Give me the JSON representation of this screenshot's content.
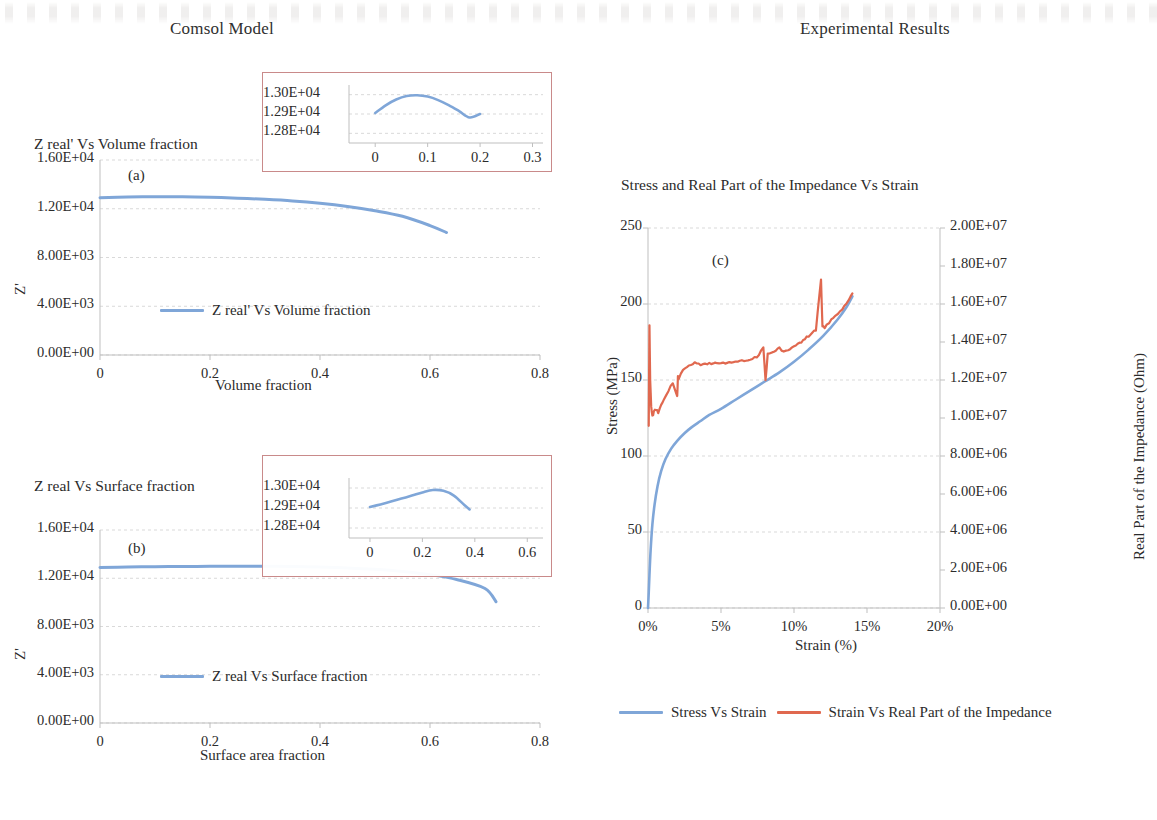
{
  "page": {
    "left_panel_title": "Comsol Model",
    "right_panel_title": "Experimental Results"
  },
  "colors": {
    "series_blue": "#7fa6d8",
    "series_red": "#e0684f",
    "inset_border": "#c98a8a",
    "gridline": "#d9d9d9",
    "axis": "#bfbfbf",
    "text": "#2b2b2b"
  },
  "chart_a": {
    "title": "Z real' Vs Volume fraction",
    "panel_letter": "(a)",
    "xlabel": "Volume fraction",
    "ylabel": "Z'",
    "legend": "Z real' Vs Volume fraction",
    "xticks": [
      "0",
      "0.2",
      "0.4",
      "0.6",
      "0.8"
    ],
    "yticks": [
      "0.00E+00",
      "4.00E+03",
      "8.00E+03",
      "1.20E+04",
      "1.60E+04"
    ],
    "inset": {
      "xticks": [
        "0",
        "0.1",
        "0.2",
        "0.3"
      ],
      "yticks": [
        "1.28E+04",
        "1.29E+04",
        "1.30E+04"
      ]
    }
  },
  "chart_b": {
    "title": "Z real Vs Surface fraction",
    "panel_letter": "(b)",
    "xlabel": "Surface area fraction",
    "ylabel": "Z'",
    "legend": "Z real Vs Surface fraction",
    "xticks": [
      "0",
      "0.2",
      "0.4",
      "0.6",
      "0.8"
    ],
    "yticks": [
      "0.00E+00",
      "4.00E+03",
      "8.00E+03",
      "1.20E+04",
      "1.60E+04"
    ],
    "inset": {
      "xticks": [
        "0",
        "0.2",
        "0.4",
        "0.6"
      ],
      "yticks": [
        "1.28E+04",
        "1.29E+04",
        "1.30E+04"
      ]
    }
  },
  "chart_c": {
    "title": "Stress and Real Part of the Impedance Vs Strain",
    "panel_letter": "(c)",
    "xlabel": "Strain (%)",
    "ylabel_left": "Stress (MPa)",
    "ylabel_right": "Real Part of the Impedance (Ohm)",
    "xticks": [
      "0%",
      "5%",
      "10%",
      "15%",
      "20%"
    ],
    "yticks_left": [
      "0",
      "50",
      "100",
      "150",
      "200",
      "250"
    ],
    "yticks_right": [
      "0.00E+00",
      "2.00E+06",
      "4.00E+06",
      "6.00E+06",
      "8.00E+06",
      "1.00E+07",
      "1.20E+07",
      "1.40E+07",
      "1.60E+07",
      "1.80E+07",
      "2.00E+07"
    ],
    "legend": [
      {
        "label": "Stress Vs Strain",
        "color": "#7fa6d8"
      },
      {
        "label": "Strain Vs Real Part of the Impedance",
        "color": "#e0684f"
      }
    ]
  },
  "chart_data": [
    {
      "type": "line",
      "id": "a",
      "title": "Z real' Vs Volume fraction",
      "xlabel": "Volume fraction",
      "ylabel": "Z'",
      "xlim": [
        0,
        0.8
      ],
      "ylim": [
        0,
        16000
      ],
      "xticks": [
        0,
        0.2,
        0.4,
        0.6,
        0.8
      ],
      "yticks": [
        0,
        4000,
        8000,
        12000,
        16000
      ],
      "grid": true,
      "legend": [
        "Z real' Vs Volume fraction"
      ],
      "legend_position": "inside-center",
      "series": [
        {
          "name": "Z real' Vs Volume fraction",
          "color": "#7fa6d8",
          "x": [
            0.0,
            0.05,
            0.1,
            0.15,
            0.2,
            0.25,
            0.3,
            0.35,
            0.4,
            0.45,
            0.5,
            0.55,
            0.6,
            0.63
          ],
          "y": [
            12900,
            12960,
            12990,
            12980,
            12940,
            12870,
            12770,
            12640,
            12450,
            12190,
            11840,
            11380,
            10620,
            10050
          ]
        }
      ],
      "inset": {
        "type": "line",
        "xlim": [
          -0.05,
          0.32
        ],
        "ylim": [
          12750,
          13050
        ],
        "xticks": [
          0,
          0.1,
          0.2,
          0.3
        ],
        "yticks": [
          12800,
          12900,
          13000
        ],
        "ytick_labels": [
          "1.28E+04",
          "1.29E+04",
          "1.30E+04"
        ],
        "series": [
          {
            "name": "Z real' Vs Volume fraction (zoom)",
            "color": "#7fa6d8",
            "x": [
              0.0,
              0.02,
              0.04,
              0.06,
              0.08,
              0.1,
              0.12,
              0.14,
              0.16,
              0.18,
              0.2
            ],
            "y": [
              12905,
              12945,
              12975,
              12993,
              12997,
              12990,
              12972,
              12946,
              12915,
              12882,
              12900
            ]
          }
        ]
      }
    },
    {
      "type": "line",
      "id": "b",
      "title": "Z real Vs Surface fraction",
      "xlabel": "Surface area fraction",
      "ylabel": "Z'",
      "xlim": [
        0,
        0.8
      ],
      "ylim": [
        0,
        16000
      ],
      "xticks": [
        0,
        0.2,
        0.4,
        0.6,
        0.8
      ],
      "yticks": [
        0,
        4000,
        8000,
        12000,
        16000
      ],
      "grid": true,
      "legend": [
        "Z real Vs Surface fraction"
      ],
      "legend_position": "inside-center",
      "series": [
        {
          "name": "Z real Vs Surface fraction",
          "color": "#7fa6d8",
          "x": [
            0.0,
            0.05,
            0.1,
            0.15,
            0.2,
            0.25,
            0.3,
            0.35,
            0.4,
            0.45,
            0.5,
            0.55,
            0.6,
            0.65,
            0.7,
            0.72
          ],
          "y": [
            12900,
            12930,
            12955,
            12975,
            12990,
            12998,
            12995,
            12975,
            12930,
            12860,
            12740,
            12560,
            12300,
            11880,
            11150,
            10050
          ]
        }
      ],
      "inset": {
        "type": "line",
        "xlim": [
          -0.08,
          0.66
        ],
        "ylim": [
          12750,
          13050
        ],
        "xticks": [
          0,
          0.2,
          0.4,
          0.6
        ],
        "yticks": [
          12800,
          12900,
          13000
        ],
        "ytick_labels": [
          "1.28E+04",
          "1.29E+04",
          "1.30E+04"
        ],
        "series": [
          {
            "name": "Z real Vs Surface fraction (zoom)",
            "color": "#7fa6d8",
            "x": [
              0.0,
              0.04,
              0.08,
              0.12,
              0.16,
              0.2,
              0.24,
              0.28,
              0.32,
              0.36,
              0.38
            ],
            "y": [
              12905,
              12918,
              12932,
              12947,
              12962,
              12978,
              12990,
              12986,
              12962,
              12915,
              12893
            ]
          }
        ]
      }
    },
    {
      "type": "line",
      "id": "c",
      "title": "Stress and Real Part of the Impedance Vs Strain",
      "xlabel": "Strain (%)",
      "ylabel_left": "Stress (MPa)",
      "ylabel_right": "Real Part of the Impedance (Ohm)",
      "xlim": [
        0,
        20
      ],
      "ylim_left": [
        0,
        250
      ],
      "ylim_right": [
        0,
        20000000
      ],
      "xticks": [
        0,
        5,
        10,
        15,
        20
      ],
      "xtick_labels": [
        "0%",
        "5%",
        "10%",
        "15%",
        "20%"
      ],
      "yticks_left": [
        0,
        50,
        100,
        150,
        200,
        250
      ],
      "yticks_right": [
        0,
        2000000,
        4000000,
        6000000,
        8000000,
        10000000,
        12000000,
        14000000,
        16000000,
        18000000,
        20000000
      ],
      "grid": true,
      "legend_position": "below",
      "series": [
        {
          "name": "Stress Vs Strain",
          "axis": "left",
          "color": "#7fa6d8",
          "x": [
            0.0,
            0.05,
            0.1,
            0.18,
            0.3,
            0.45,
            0.65,
            0.9,
            1.2,
            1.6,
            2.0,
            2.5,
            3.0,
            3.6,
            4.2,
            5.0,
            6.0,
            7.0,
            8.0,
            9.0,
            10.0,
            11.0,
            12.0,
            13.0,
            13.6,
            14.0
          ],
          "y": [
            0,
            10,
            22,
            38,
            55,
            68,
            80,
            90,
            98,
            105,
            110,
            115,
            119,
            123,
            127,
            131,
            137,
            143,
            149,
            155,
            162,
            170,
            179,
            190,
            198,
            205
          ]
        },
        {
          "name": "Strain Vs Real Part of the Impedance",
          "axis": "right",
          "color": "#e0684f",
          "x": [
            0.05,
            0.1,
            0.15,
            0.22,
            0.3,
            0.4,
            0.55,
            0.7,
            0.9,
            1.1,
            1.4,
            1.7,
            2.0,
            2.05,
            2.1,
            2.4,
            2.8,
            3.2,
            3.6,
            4.2,
            5.0,
            6.0,
            7.0,
            7.6,
            7.9,
            8.05,
            8.2,
            8.5,
            9.0,
            9.3,
            9.6,
            10.0,
            10.5,
            11.0,
            11.5,
            11.85,
            11.95,
            12.1,
            12.4,
            13.0,
            13.6,
            14.0
          ],
          "y_mpa_equiv": [
            120,
            186,
            150,
            133,
            126,
            129,
            131,
            128,
            133,
            138,
            143,
            148,
            139,
            152,
            150,
            157,
            160,
            161,
            160,
            161,
            161,
            162,
            163,
            166,
            172,
            150,
            167,
            168,
            171,
            168,
            170,
            172,
            175,
            179,
            183,
            216,
            185,
            184,
            188,
            194,
            200,
            207
          ],
          "note": "plotted against the right-hand impedance axis; values listed in left-axis pixel-equivalent units"
        }
      ]
    }
  ]
}
